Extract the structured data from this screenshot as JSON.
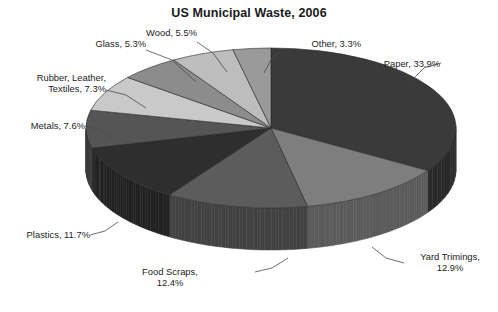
{
  "chart_data": {
    "type": "pie",
    "title": "US Municipal Waste, 2006",
    "xlabel": "",
    "ylabel": "",
    "legend_position": "none",
    "grid": false,
    "units": "percent",
    "categories": [
      "Paper",
      "Yard Trimings",
      "Food Scraps",
      "Plastics",
      "Metals",
      "Rubber, Leather, Textiles",
      "Glass",
      "Wood",
      "Other"
    ],
    "values": [
      33.9,
      12.9,
      12.4,
      11.7,
      7.6,
      7.3,
      5.3,
      5.5,
      3.3
    ],
    "slices": [
      {
        "label": "Paper",
        "value": 33.9,
        "text": "Paper, 33.9%",
        "color": "#3a3a3a"
      },
      {
        "label": "Yard Trimings",
        "value": 12.9,
        "text": "Yard Trimings,\n12.9%",
        "color": "#7e7e7e"
      },
      {
        "label": "Food Scraps",
        "value": 12.4,
        "text": "Food Scraps,\n12.4%",
        "color": "#5c5c5c"
      },
      {
        "label": "Plastics",
        "value": 11.7,
        "text": "Plastics, 11.7%",
        "color": "#2e2e2e"
      },
      {
        "label": "Metals",
        "value": 7.6,
        "text": "Metals, 7.6%",
        "color": "#555555"
      },
      {
        "label": "Rubber, Leather, Textiles",
        "value": 7.3,
        "text": "Rubber, Leather,\nTextiles, 7.3%",
        "color": "#c9c9c9"
      },
      {
        "label": "Glass",
        "value": 5.3,
        "text": "Glass, 5.3%",
        "color": "#8c8c8c"
      },
      {
        "label": "Wood",
        "value": 5.5,
        "text": "Wood, 5.5%",
        "color": "#bdbdbd"
      },
      {
        "label": "Other",
        "value": 3.3,
        "text": "Other, 3.3%",
        "color": "#9a9a9a"
      }
    ]
  },
  "labels": {
    "paper": "Paper, 33.9%",
    "yard_trimings": "Yard Trimings,\n12.9%",
    "food_scraps": "Food Scraps,\n12.4%",
    "plastics": "Plastics, 11.7%",
    "metals": "Metals, 7.6%",
    "rubber": "Rubber, Leather,\nTextiles, 7.3%",
    "glass": "Glass, 5.3%",
    "wood": "Wood, 5.5%",
    "other": "Other, 3.3%"
  },
  "colors": {
    "background": "#ffffff",
    "text": "#1c1c1c",
    "leader_line": "#4a4a4a"
  }
}
